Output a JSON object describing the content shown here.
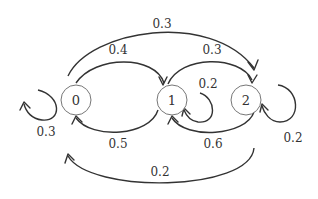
{
  "diagram": {
    "type": "markov-chain",
    "colors": {
      "stroke": "#333333",
      "node_stroke": "#777777",
      "background": "#ffffff"
    },
    "nodes": [
      {
        "id": "0",
        "label": "0"
      },
      {
        "id": "1",
        "label": "1"
      },
      {
        "id": "2",
        "label": "2"
      }
    ],
    "edges": [
      {
        "from": "0",
        "to": "0",
        "label": "0.3"
      },
      {
        "from": "0",
        "to": "1",
        "label": "0.4"
      },
      {
        "from": "0",
        "to": "2",
        "label": "0.3"
      },
      {
        "from": "1",
        "to": "0",
        "label": "0.5"
      },
      {
        "from": "1",
        "to": "1",
        "label": "0.2"
      },
      {
        "from": "1",
        "to": "2",
        "label": "0.3"
      },
      {
        "from": "2",
        "to": "0",
        "label": "0.2"
      },
      {
        "from": "2",
        "to": "1",
        "label": "0.6"
      },
      {
        "from": "2",
        "to": "2",
        "label": "0.2"
      }
    ]
  }
}
